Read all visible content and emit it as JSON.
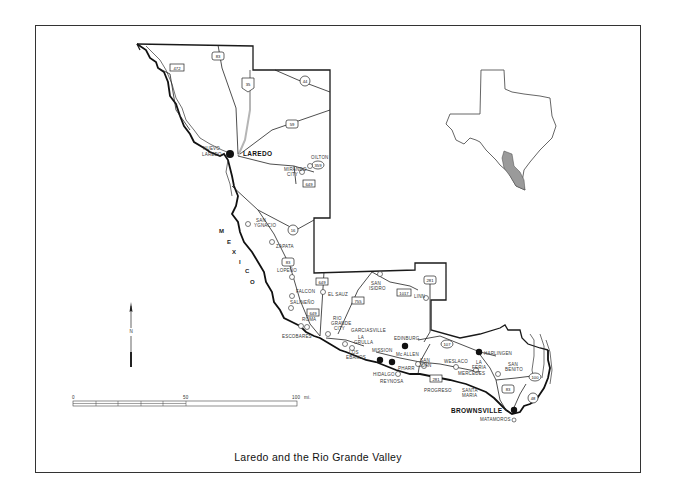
{
  "caption": "Laredo and the Rio Grande Valley",
  "country_label": [
    "M",
    "E",
    "X",
    "I",
    "C",
    "O"
  ],
  "north_arrow": {
    "letter": "N"
  },
  "scale_bar": {
    "ticks": [
      "0",
      "50",
      "100"
    ],
    "unit": "mi."
  },
  "cities_major": {
    "laredo": "LAREDO",
    "brownsville": "BROWNSVILLE"
  },
  "cities": {
    "nuevo_laredo_1": "NUEVO",
    "nuevo_laredo_2": "LAREDO",
    "el_toro": "OILTON",
    "mirando_1": "MIRANDO",
    "mirando_2": "CITY",
    "san_ygnacio_1": "SAN",
    "san_ygnacio_2": "YGNACIO",
    "zapata": "ZAPATA",
    "lopeno": "LOPEÑO",
    "falcon": "FALCON",
    "salineno": "SALINEÑO",
    "roma": "ROMA",
    "escobares": "ESCOBARES",
    "el_sauz": "EL SAUZ",
    "rio_grande_1": "RIO",
    "rio_grande_2": "GRANDE",
    "rio_grande_3": "CITY",
    "san_isidro_1": "SAN",
    "san_isidro_2": "ISIDRO",
    "linn": "LINN",
    "garciasville": "GARCIASVILLE",
    "la_grulla_1": "LA",
    "la_grulla_2": "GRULLA",
    "los_ebanos_1": "LOS",
    "los_ebanos_2": "EBANOS",
    "edinburg": "EDINBURG",
    "mission": "MISSION",
    "mcallen": "Mc ALLEN",
    "pharr": "PHARR",
    "san_juan_1": "SAN",
    "san_juan_2": "JUAN",
    "hidalgo": "HIDALGO",
    "reynosa": "REYNOSA",
    "progreso": "PROGRESO",
    "weslaco": "WESLACO",
    "la_feria_1": "LA",
    "la_feria_2": "FERIA",
    "mercedes": "MERCEDES",
    "santa_maria_1": "SANTA",
    "santa_maria_2": "MARIA",
    "harlingen": "HARLINGEN",
    "san_benito_1": "SAN",
    "san_benito_2": "BENITO",
    "matamoros": "MATAMOROS"
  },
  "highways": {
    "h83_n": "83",
    "h35": "35",
    "h472": "472",
    "h44": "44",
    "h59": "59",
    "h359": "359",
    "h649_n": "649",
    "h16": "16",
    "h83_z": "83",
    "h649_a": "649",
    "h649_b": "649",
    "h755": "755",
    "h1017": "1017",
    "h281": "281",
    "h107": "107",
    "h281_s": "281",
    "h83_s": "83",
    "h100": "100",
    "h48": "48"
  },
  "colors": {
    "ink": "#1a1a1a",
    "interstate": "#b5b5b5",
    "inset_region": "#9a9a9a"
  }
}
